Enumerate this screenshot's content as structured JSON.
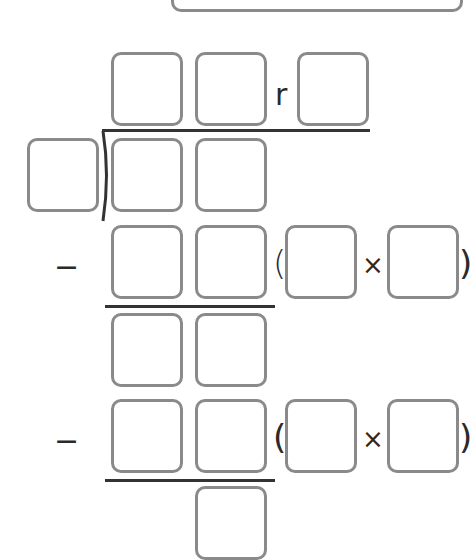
{
  "worksheet": {
    "title": "Long division with remainder",
    "answer_box": {
      "value": "",
      "placeholder": ""
    },
    "quotient": {
      "digits": [
        "",
        ""
      ],
      "remainder_label": "r",
      "remainder": ""
    },
    "divisor": "",
    "dividend": [
      "",
      ""
    ],
    "steps": [
      {
        "operator": "−",
        "subtrahend": [
          "",
          ""
        ],
        "open_paren": "(",
        "factor_a": "",
        "times": "×",
        "factor_b": "",
        "close_paren": ")",
        "difference": [
          "",
          ""
        ]
      },
      {
        "operator": "−",
        "subtrahend": [
          "",
          ""
        ],
        "open_paren": "(",
        "factor_a": "",
        "times": "×",
        "factor_b": "",
        "close_paren": ")",
        "difference": [
          ""
        ]
      }
    ],
    "colors": {
      "box_border": "#8a8a8a",
      "line": "#333333",
      "text": "#2a2a2a"
    }
  }
}
